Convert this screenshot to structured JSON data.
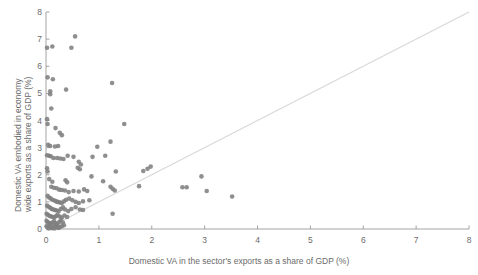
{
  "chart_data": {
    "type": "scatter",
    "title": "",
    "xlabel": "Domestic VA in the sector's exports as a share of GDP (%)",
    "ylabel_line1": "Domestic VA embodied in economy",
    "ylabel_line2": "wide exports as a share of GDP (%)",
    "xlim": [
      0,
      8
    ],
    "ylim": [
      0,
      8
    ],
    "xticks": [
      "0",
      "1",
      "2",
      "3",
      "4",
      "5",
      "6",
      "7",
      "8"
    ],
    "yticks": [
      "0",
      "1",
      "2",
      "3",
      "4",
      "5",
      "6",
      "7",
      "8"
    ],
    "grid": false,
    "legend": "none",
    "marker_color": "#7f7f7f",
    "marker_size": 4.6,
    "reference_line": {
      "name": "45-degree-line",
      "from": [
        0,
        0
      ],
      "to": [
        8,
        8
      ],
      "color": "#d9d9d9"
    },
    "points": [
      [
        0.55,
        7.1
      ],
      [
        0.02,
        6.68
      ],
      [
        0.12,
        6.73
      ],
      [
        0.48,
        6.68
      ],
      [
        0.03,
        5.59
      ],
      [
        0.13,
        5.52
      ],
      [
        1.25,
        5.38
      ],
      [
        0.08,
        5.08
      ],
      [
        0.08,
        4.97
      ],
      [
        0.38,
        5.14
      ],
      [
        0.1,
        4.44
      ],
      [
        0.02,
        4.05
      ],
      [
        0.03,
        3.87
      ],
      [
        1.48,
        3.87
      ],
      [
        0.18,
        3.72
      ],
      [
        0.26,
        3.55
      ],
      [
        0.3,
        3.46
      ],
      [
        0.04,
        3.1
      ],
      [
        0.08,
        3.06
      ],
      [
        0.17,
        3.04
      ],
      [
        0.23,
        3.06
      ],
      [
        0.97,
        3.03
      ],
      [
        1.22,
        3.22
      ],
      [
        0.02,
        2.72
      ],
      [
        0.06,
        2.7
      ],
      [
        0.09,
        2.68
      ],
      [
        0.14,
        2.62
      ],
      [
        0.21,
        2.62
      ],
      [
        0.27,
        2.6
      ],
      [
        0.33,
        2.58
      ],
      [
        0.41,
        2.7
      ],
      [
        0.52,
        2.66
      ],
      [
        0.62,
        2.48
      ],
      [
        0.66,
        2.38
      ],
      [
        0.88,
        2.66
      ],
      [
        1.12,
        2.7
      ],
      [
        0.02,
        2.24
      ],
      [
        0.03,
        2.12
      ],
      [
        0.6,
        2.26
      ],
      [
        0.64,
        2.2
      ],
      [
        1.32,
        2.12
      ],
      [
        1.84,
        2.14
      ],
      [
        1.92,
        2.22
      ],
      [
        1.98,
        2.3
      ],
      [
        0.06,
        1.84
      ],
      [
        0.12,
        1.74
      ],
      [
        0.37,
        1.8
      ],
      [
        0.4,
        1.72
      ],
      [
        0.86,
        1.94
      ],
      [
        2.94,
        1.94
      ],
      [
        0.1,
        1.56
      ],
      [
        0.15,
        1.52
      ],
      [
        0.2,
        1.5
      ],
      [
        0.25,
        1.45
      ],
      [
        0.3,
        1.44
      ],
      [
        0.36,
        1.42
      ],
      [
        0.43,
        1.36
      ],
      [
        0.52,
        1.4
      ],
      [
        0.62,
        1.38
      ],
      [
        0.72,
        1.46
      ],
      [
        0.78,
        1.4
      ],
      [
        1.08,
        1.76
      ],
      [
        1.22,
        1.56
      ],
      [
        1.26,
        1.48
      ],
      [
        1.3,
        1.42
      ],
      [
        1.76,
        1.58
      ],
      [
        2.58,
        1.54
      ],
      [
        2.66,
        1.54
      ],
      [
        3.04,
        1.4
      ],
      [
        3.52,
        1.2
      ],
      [
        0.03,
        1.22
      ],
      [
        0.06,
        1.16
      ],
      [
        0.09,
        1.12
      ],
      [
        0.12,
        1.08
      ],
      [
        0.16,
        1.05
      ],
      [
        0.19,
        1.02
      ],
      [
        0.22,
        1.0
      ],
      [
        0.26,
        0.98
      ],
      [
        0.3,
        0.96
      ],
      [
        0.34,
        1.02
      ],
      [
        0.38,
        1.08
      ],
      [
        0.44,
        1.12
      ],
      [
        0.5,
        1.06
      ],
      [
        0.56,
        1.0
      ],
      [
        0.62,
        0.96
      ],
      [
        0.7,
        1.02
      ],
      [
        0.82,
        1.06
      ],
      [
        0.02,
        0.86
      ],
      [
        0.05,
        0.82
      ],
      [
        0.08,
        0.78
      ],
      [
        0.11,
        0.74
      ],
      [
        0.14,
        0.72
      ],
      [
        0.17,
        0.7
      ],
      [
        0.2,
        0.68
      ],
      [
        0.24,
        0.66
      ],
      [
        0.28,
        0.74
      ],
      [
        0.32,
        0.8
      ],
      [
        0.36,
        0.72
      ],
      [
        0.42,
        0.66
      ],
      [
        0.48,
        0.74
      ],
      [
        0.56,
        0.8
      ],
      [
        0.64,
        0.72
      ],
      [
        0.7,
        0.7
      ],
      [
        0.01,
        0.56
      ],
      [
        0.04,
        0.52
      ],
      [
        0.07,
        0.48
      ],
      [
        0.1,
        0.46
      ],
      [
        0.13,
        0.44
      ],
      [
        0.16,
        0.42
      ],
      [
        0.19,
        0.48
      ],
      [
        0.22,
        0.52
      ],
      [
        0.26,
        0.46
      ],
      [
        0.3,
        0.42
      ],
      [
        0.35,
        0.5
      ],
      [
        0.4,
        0.44
      ],
      [
        1.26,
        0.56
      ],
      [
        0.01,
        0.3
      ],
      [
        0.03,
        0.26
      ],
      [
        0.06,
        0.22
      ],
      [
        0.09,
        0.2
      ],
      [
        0.12,
        0.24
      ],
      [
        0.15,
        0.28
      ],
      [
        0.18,
        0.22
      ],
      [
        0.21,
        0.18
      ],
      [
        0.25,
        0.26
      ],
      [
        0.28,
        0.32
      ],
      [
        0.32,
        0.24
      ],
      [
        0.01,
        0.1
      ],
      [
        0.04,
        0.08
      ],
      [
        0.07,
        0.12
      ],
      [
        0.1,
        0.06
      ],
      [
        0.14,
        0.1
      ],
      [
        0.18,
        0.08
      ],
      [
        0.22,
        0.12
      ],
      [
        0.26,
        0.06
      ],
      [
        0.3,
        0.1
      ],
      [
        0.34,
        0.14
      ],
      [
        0.05,
        0.02
      ],
      [
        0.11,
        0.03
      ],
      [
        0.16,
        0.02
      ],
      [
        0.23,
        0.04
      ]
    ]
  }
}
